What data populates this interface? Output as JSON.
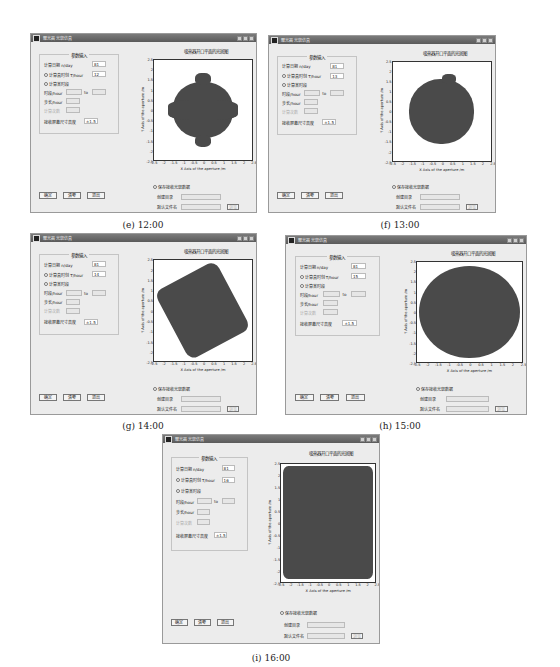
{
  "window_title": "聚光器光斑仿真",
  "panel_group_title": "参数输入",
  "labels": {
    "day": "计算日期 n/day",
    "hour": "计算真时刻 T/hour",
    "period": "计算某时段",
    "period_range": "时段/hour",
    "to": "to",
    "step": "步长/hour",
    "disabled_field": "计算次数",
    "receiver_size": "接收屏幕尺寸高度"
  },
  "buttons": {
    "ok": "确定",
    "clear": "清零",
    "exit": "退出",
    "browse": "浏览"
  },
  "save": {
    "checkbox": "保存接收光斑数据",
    "path_label": "创建目录",
    "filename_label": "默认文件名"
  },
  "plot": {
    "title": "吸热器开口平面的光斑图",
    "xlabel": "X Axis of the aperture /m",
    "ylabel": "Y Axis of the aperture /m",
    "ticks": [
      "-2.5",
      "-2",
      "-1.5",
      "-1",
      "-0.5",
      "0",
      "0.5",
      "1",
      "1.5",
      "2",
      "2.5"
    ]
  },
  "panels": [
    {
      "id": "e",
      "caption": "(e)  12:00",
      "day": "81",
      "hour": "12",
      "receiver": "±1.5"
    },
    {
      "id": "f",
      "caption": "(f)  13:00",
      "day": "81",
      "hour": "13",
      "receiver": "±1.5"
    },
    {
      "id": "g",
      "caption": "(g)  14:00",
      "day": "81",
      "hour": "14",
      "receiver": "±1.5"
    },
    {
      "id": "h",
      "caption": "(h)  15:00",
      "day": "81",
      "hour": "15",
      "receiver": "±1.5"
    },
    {
      "id": "i",
      "caption": "(i)  16:00",
      "day": "81",
      "hour": "16",
      "receiver": "±1.5"
    }
  ],
  "chart_data": [
    {
      "type": "scatter",
      "title": "吸热器开口平面的光斑图",
      "time": "12:00",
      "xlabel": "X Axis of the aperture /m",
      "ylabel": "Y Axis of the aperture /m",
      "xlim": [
        -2.5,
        2.5
      ],
      "ylim": [
        -2.5,
        2.5
      ],
      "shape": "scalloped circle",
      "approx_extent_x": [
        -1.8,
        1.8
      ],
      "approx_extent_y": [
        -2.0,
        1.9
      ]
    },
    {
      "type": "scatter",
      "title": "吸热器开口平面的光斑图",
      "time": "13:00",
      "xlim": [
        -2.5,
        2.5
      ],
      "ylim": [
        -2.5,
        2.5
      ],
      "shape": "rough circle",
      "approx_extent_x": [
        -1.8,
        1.9
      ],
      "approx_extent_y": [
        -2.1,
        1.9
      ]
    },
    {
      "type": "scatter",
      "title": "吸热器开口平面的光斑图",
      "time": "14:00",
      "xlim": [
        -2.5,
        2.5
      ],
      "ylim": [
        -2.5,
        2.5
      ],
      "shape": "rotated square",
      "approx_extent_x": [
        -2.0,
        1.8
      ],
      "approx_extent_y": [
        -2.2,
        2.1
      ]
    },
    {
      "type": "scatter",
      "title": "吸热器开口平面的光斑图",
      "time": "15:00",
      "xlim": [
        -2.5,
        2.5
      ],
      "ylim": [
        -2.5,
        2.5
      ],
      "shape": "large ellipse",
      "approx_extent_x": [
        -2.5,
        2.5
      ],
      "approx_extent_y": [
        -2.4,
        2.5
      ]
    },
    {
      "type": "scatter",
      "title": "吸热器开口平面的光斑图",
      "time": "16:00",
      "xlim": [
        -2.5,
        2.5
      ],
      "ylim": [
        -2.5,
        2.5
      ],
      "shape": "fills square",
      "approx_extent_x": [
        -2.5,
        2.5
      ],
      "approx_extent_y": [
        -2.5,
        2.5
      ]
    }
  ]
}
